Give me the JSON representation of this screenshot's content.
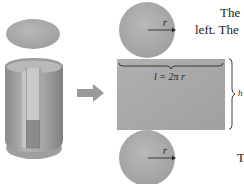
{
  "figure": {
    "labels": {
      "radius_top": "r",
      "radius_bottom": "r",
      "length": "l = 2π r",
      "height": "h"
    },
    "colors": {
      "surface": "#a9a9a9",
      "surface_dark": "#8e8e8e",
      "surface_light": "#c4c4c4",
      "arrow": "#9a9a9a",
      "line": "#333333"
    }
  },
  "text_fragments": {
    "line1": "The",
    "line2": "left. The",
    "line3": "T"
  }
}
